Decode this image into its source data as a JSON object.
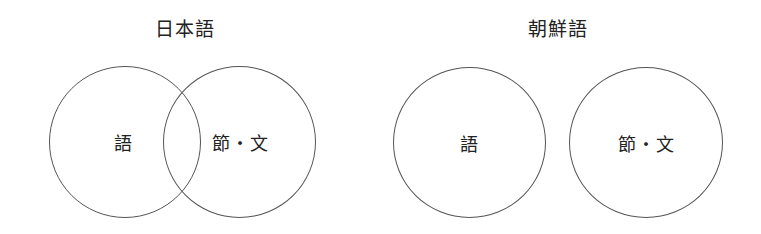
{
  "diagrams": [
    {
      "title": "日本語",
      "relation": "overlapping",
      "sets": [
        {
          "label": "語"
        },
        {
          "label": "節・文"
        }
      ]
    },
    {
      "title": "朝鮮語",
      "relation": "disjoint",
      "sets": [
        {
          "label": "語"
        },
        {
          "label": "節・文"
        }
      ]
    }
  ]
}
